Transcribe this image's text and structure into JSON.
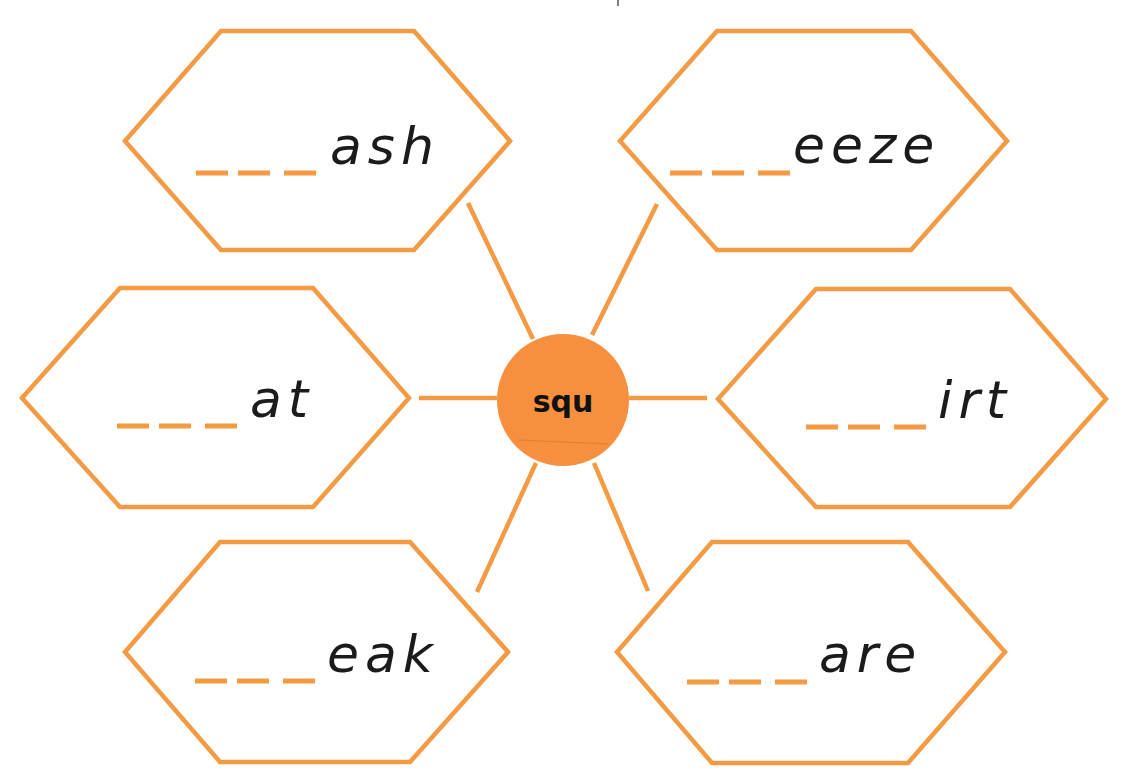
{
  "worksheet": {
    "center": {
      "label": "squ",
      "fill_color": "#f6903f"
    },
    "accent_color": "#f39a43",
    "blank_placeholder": "___",
    "cards": [
      {
        "position": "top-left",
        "ending": "ash"
      },
      {
        "position": "top-right",
        "ending": "eeze"
      },
      {
        "position": "middle-left",
        "ending": "at"
      },
      {
        "position": "middle-right",
        "ending": "irt"
      },
      {
        "position": "bottom-left",
        "ending": "eak"
      },
      {
        "position": "bottom-right",
        "ending": "are"
      }
    ]
  }
}
